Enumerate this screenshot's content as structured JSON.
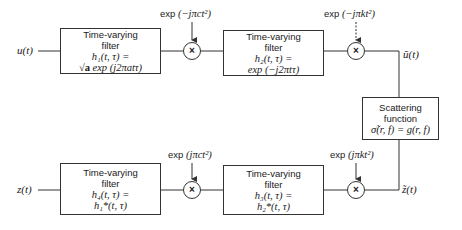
{
  "diagram": {
    "signals": {
      "input": "u(t)",
      "output": "z(t)",
      "intermediate_top": "ũ(t)",
      "intermediate_bottom": "z̃(t)"
    },
    "filters": [
      {
        "id": "h1",
        "title": "Time-varying",
        "subtitle": "filter",
        "eq_line1": "h₁(t, τ) =",
        "eq_line2_prefix": "√a",
        "eq_line2": " exp (j2πatτ)"
      },
      {
        "id": "h2",
        "title": "Time-varying",
        "subtitle": "filter",
        "eq_line1": "h₂(t, τ) =",
        "eq_line2_prefix": "",
        "eq_line2": "exp (−j2πtτ)"
      },
      {
        "id": "h3",
        "title": "Time-varying",
        "subtitle": "filter",
        "eq_line1": "h₃(t, τ) =",
        "eq_line2_prefix": "",
        "eq_line2": "h₂*(t, τ)"
      },
      {
        "id": "h4",
        "title": "Time-varying",
        "subtitle": "filter",
        "eq_line1": "h₄(t, τ) =",
        "eq_line2_prefix": "",
        "eq_line2": "h₁*(t, τ)"
      }
    ],
    "multipliers": [
      {
        "id": "m1",
        "symbol": "×",
        "label_prefix": "exp ",
        "label_expr": "(−jπct²)"
      },
      {
        "id": "m2",
        "symbol": "×",
        "label_prefix": "exp ",
        "label_expr": "(−jπkt²)"
      },
      {
        "id": "m3",
        "symbol": "×",
        "label_prefix": "exp ",
        "label_expr": "(jπkt²)"
      },
      {
        "id": "m4",
        "symbol": "×",
        "label_prefix": "exp ",
        "label_expr": "(jπct²)"
      }
    ],
    "scattering": {
      "title": "Scattering",
      "subtitle": "function",
      "equation": "σ̃(r, f) = g(r, f)"
    },
    "colors": {
      "line": "#333333",
      "text": "#1a1a1a",
      "background": "#ffffff"
    }
  }
}
